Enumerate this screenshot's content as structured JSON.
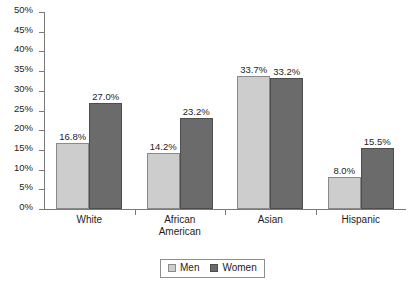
{
  "chart_data": {
    "type": "bar",
    "title": "",
    "xlabel": "",
    "ylabel": "",
    "categories": [
      "White",
      "African\nAmerican",
      "Asian",
      "Hispanic"
    ],
    "series": [
      {
        "name": "Men",
        "color": "#cdcdcd",
        "values": [
          16.8,
          14.2,
          33.7,
          8.0
        ],
        "labels": [
          "16.8%",
          "14.2%",
          "33.7%",
          "8.0%"
        ]
      },
      {
        "name": "Women",
        "color": "#6b6b6b",
        "values": [
          27.0,
          23.2,
          33.2,
          15.5
        ],
        "labels": [
          "27.0%",
          "23.2%",
          "33.2%",
          "15.5%"
        ]
      }
    ],
    "ylim": [
      0,
      50
    ],
    "ytick_values": [
      50,
      45,
      40,
      35,
      30,
      25,
      20,
      15,
      10,
      5,
      0
    ],
    "ytick_labels": [
      "50%",
      "45%",
      "40%",
      "35%",
      "30%",
      "25%",
      "20%",
      "15%",
      "10%",
      "5%",
      "0%"
    ],
    "grid": false,
    "legend_position": "bottom-center",
    "legend_entries": [
      "Men",
      "Women"
    ]
  },
  "axis": {
    "y_labels": [
      "50%",
      "45%",
      "40%",
      "35%",
      "30%",
      "25%",
      "20%",
      "15%",
      "10%",
      "5%",
      "0%"
    ],
    "x_labels": [
      "White",
      "African\nAmerican",
      "Asian",
      "Hispanic"
    ]
  },
  "bar_labels": {
    "white_men": "16.8%",
    "white_women": "27.0%",
    "african_american_men": "14.2%",
    "african_american_women": "23.2%",
    "asian_men": "33.7%",
    "asian_women": "33.2%",
    "hispanic_men": "8.0%",
    "hispanic_women": "15.5%"
  },
  "legend": {
    "men": "Men",
    "women": "Women"
  },
  "colors": {
    "men_fill": "#cdcdcd",
    "women_fill": "#6b6b6b",
    "axis": "#7a7a7a",
    "text": "#1d1d1d",
    "background": "#ffffff"
  }
}
